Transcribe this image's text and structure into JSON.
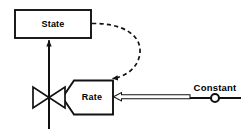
{
  "diagram": {
    "type": "system-dynamics-stock-and-flow",
    "title": "",
    "background_color": "#ffffff",
    "stroke_color": "#000000",
    "nodes": [
      {
        "id": "state",
        "label": "State",
        "kind": "stock-box",
        "shape": "rectangle",
        "x": 15,
        "y": 10,
        "width": 76,
        "height": 28
      },
      {
        "id": "rate",
        "label": "Rate",
        "kind": "flow-rate-box",
        "shape": "pentagon-notched-left",
        "x": 62,
        "y": 80,
        "width": 51,
        "height": 35
      },
      {
        "id": "constant",
        "label": "Constant",
        "kind": "constant",
        "shape": "line-with-circle",
        "x": 186,
        "y": 83,
        "width": 58,
        "height": 16
      }
    ],
    "connectors": [
      {
        "id": "state-to-rate-influence",
        "from": "state",
        "to": "rate",
        "style": "dashed-curved-arrow",
        "arrowhead": "solid-filled",
        "description": "curved dashed influence link from State right edge down into Rate top-right"
      },
      {
        "id": "constant-to-rate-link",
        "from": "constant",
        "to": "rate",
        "style": "hollow-outlined-arrow",
        "arrowhead": "hollow-open",
        "description": "double-line hollow arrow pointing left from Constant into Rate right edge"
      },
      {
        "id": "flow-pipe",
        "from": "source-below",
        "to": "state",
        "style": "solid-vertical-flow-pipe",
        "arrowhead": "solid-filled",
        "description": "vertical flow pipe through valve upward into State bottom"
      }
    ],
    "glyphs": [
      {
        "id": "valve",
        "name": "bowtie-valve-icon",
        "cx": 49,
        "cy": 97,
        "half_width": 16,
        "half_height": 11
      },
      {
        "id": "constant-knob",
        "name": "constant-circle-icon",
        "cx": 215,
        "cy": 98,
        "r": 4
      }
    ]
  }
}
